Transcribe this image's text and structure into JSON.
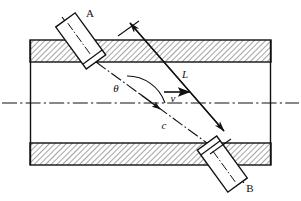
{
  "figure": {
    "background_color": "#ffffff",
    "line_color": "#111111",
    "wall_fill_color": "#c8c8c8",
    "width": 301,
    "height": 201
  },
  "labels": {
    "transducer_a": "A",
    "transducer_b": "B",
    "path_length": "L",
    "angle": "θ",
    "velocity": "v",
    "sound_speed": "c"
  },
  "elements": {
    "pipe_name": "pipe-body",
    "top_wall_name": "pipe-top-wall",
    "bottom_wall_name": "pipe-bottom-wall",
    "bore_name": "pipe-bore",
    "centerline_name": "pipe-centerline",
    "beam_name": "ultrasonic-beam-path",
    "dimension_name": "path-length-dimension",
    "angle_arc_name": "angle-arc",
    "velocity_arrow_name": "flow-velocity-arrow"
  },
  "geometry": {
    "pipe_left": 30,
    "pipe_right": 271,
    "top_wall_y": 40,
    "top_wall_bottom": 62,
    "bottom_wall_y": 143,
    "bottom_wall_bottom": 165,
    "centerline_y": 103,
    "beam_angle_deg": 39,
    "beam_start_x": 96,
    "beam_start_y": 62,
    "beam_end_x": 207,
    "beam_end_y": 143
  }
}
